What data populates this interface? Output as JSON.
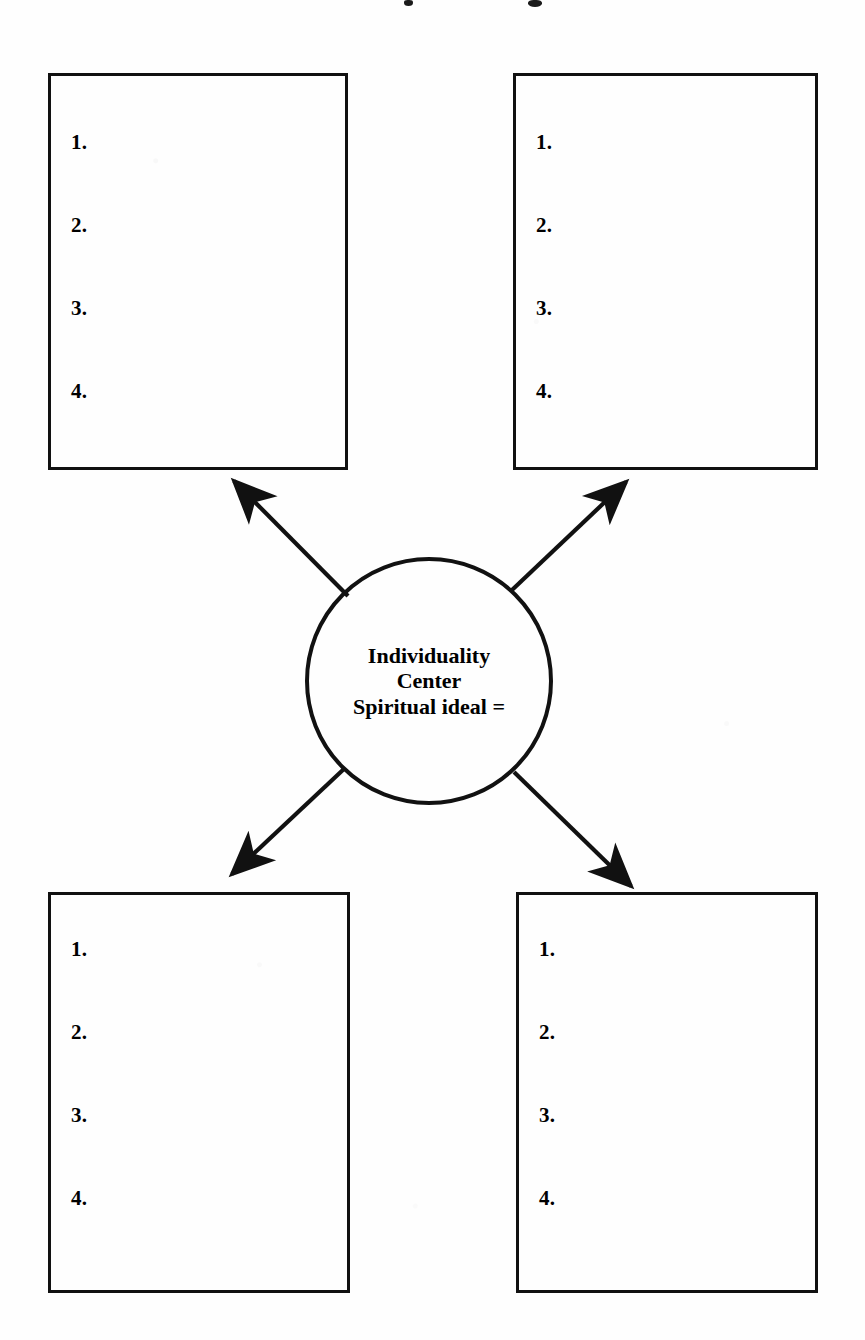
{
  "page": {
    "background_color": "#fefefe",
    "ink_color": "#111111",
    "width": 865,
    "height": 1340,
    "title_cut_off": true
  },
  "center_node": {
    "shape": "circle",
    "lines": [
      "Individuality",
      "Center",
      "Spiritual ideal ="
    ],
    "line1": "Individuality",
    "line2": "Center",
    "line3": "Spiritual ideal ="
  },
  "list_numbers": [
    "1.",
    "2.",
    "3.",
    "4."
  ],
  "boxes": [
    {
      "id": "top-left",
      "position": "top-left",
      "items": [
        "1.",
        "2.",
        "3.",
        "4."
      ]
    },
    {
      "id": "top-right",
      "position": "top-right",
      "items": [
        "1.",
        "2.",
        "3.",
        "4."
      ]
    },
    {
      "id": "bottom-left",
      "position": "bottom-left",
      "items": [
        "1.",
        "2.",
        "3.",
        "4."
      ]
    },
    {
      "id": "bottom-right",
      "position": "bottom-right",
      "items": [
        "1.",
        "2.",
        "3.",
        "4."
      ]
    }
  ],
  "arrows": [
    {
      "id": "to-top-left",
      "from": "center_node",
      "to": "top-left",
      "direction": "up-left"
    },
    {
      "id": "to-top-right",
      "from": "center_node",
      "to": "top-right",
      "direction": "up-right"
    },
    {
      "id": "to-bottom-left",
      "from": "center_node",
      "to": "bottom-left",
      "direction": "down-left"
    },
    {
      "id": "to-bottom-right",
      "from": "center_node",
      "to": "bottom-right",
      "direction": "down-right"
    }
  ]
}
